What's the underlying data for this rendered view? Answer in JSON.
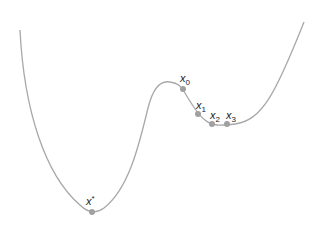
{
  "diagram": {
    "colors": {
      "curve": "#a8a8a8",
      "points": "#a0a0a0",
      "labels": "#222222"
    },
    "points": [
      {
        "id": "x0",
        "label": "x",
        "subscript": "0",
        "cx": 183,
        "cy": 89
      },
      {
        "id": "x1",
        "label": "x",
        "subscript": "1",
        "cx": 198,
        "cy": 114
      },
      {
        "id": "x2",
        "label": "x",
        "subscript": "2",
        "cx": 212,
        "cy": 124
      },
      {
        "id": "x3",
        "label": "x",
        "subscript": "3",
        "cx": 227,
        "cy": 124
      },
      {
        "id": "xstar",
        "label": "x",
        "superscript": "*",
        "cx": 92,
        "cy": 212
      }
    ]
  }
}
